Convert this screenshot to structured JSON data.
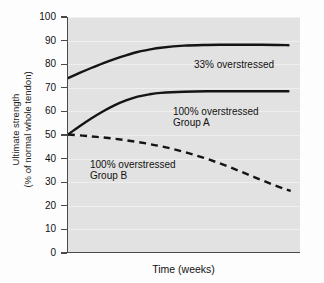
{
  "chart_data": {
    "type": "line",
    "title": "",
    "xlabel": "Time (weeks)",
    "ylabel": "Ultimate strength (% of normal whole tendon)",
    "ylabel_line1": "Ultimate strength",
    "ylabel_line2": "(% of normal whole tendon)",
    "ylim": [
      0,
      100
    ],
    "yticks": [
      100,
      90,
      80,
      70,
      60,
      50,
      40,
      30,
      20,
      10,
      0
    ],
    "ytick_labels": [
      "100",
      "90",
      "80",
      "70",
      "60",
      "50",
      "40",
      "30",
      "20",
      "10",
      "0"
    ],
    "xlim": [
      0,
      10
    ],
    "xticks": [],
    "xtick_labels": [],
    "grid": "horizontal-faint",
    "legend_position": "inline-annotations",
    "plot_background": "#e2e2e2",
    "line_color": "#141414",
    "series": [
      {
        "name": "33% overstressed",
        "style": "solid",
        "x": [
          0.0,
          0.5,
          1.0,
          1.5,
          2.0,
          2.5,
          3.0,
          3.5,
          4.0,
          5.0,
          6.0,
          7.0,
          8.0,
          9.0,
          9.5
        ],
        "values": [
          74.0,
          76.2,
          78.3,
          80.3,
          82.1,
          83.7,
          85.1,
          86.1,
          86.9,
          87.8,
          88.1,
          88.2,
          88.2,
          88.1,
          88.0
        ]
      },
      {
        "name": "100% overstressed Group A",
        "style": "solid",
        "x": [
          0.0,
          0.5,
          1.0,
          1.5,
          2.0,
          2.5,
          3.0,
          3.5,
          4.0,
          5.0,
          6.0,
          7.0,
          8.0,
          9.0,
          9.5
        ],
        "values": [
          50.0,
          53.5,
          56.8,
          59.8,
          62.4,
          64.5,
          66.1,
          67.1,
          67.7,
          68.2,
          68.4,
          68.4,
          68.4,
          68.4,
          68.4
        ]
      },
      {
        "name": "100% overstressed Group B",
        "style": "dashed",
        "x": [
          0.0,
          1.0,
          2.0,
          3.0,
          4.0,
          5.0,
          6.0,
          7.0,
          8.0,
          9.0,
          9.6
        ],
        "values": [
          50.0,
          49.2,
          48.2,
          46.8,
          45.0,
          42.6,
          39.6,
          36.0,
          32.0,
          28.0,
          26.0
        ]
      }
    ],
    "annotations": [
      {
        "text": "33% overstressed",
        "x_px": 193,
        "y_px": 59
      },
      {
        "text": "100% overstressed",
        "x_px": 172,
        "y_px": 106
      },
      {
        "text": "Group A",
        "x_px": 172,
        "y_px": 117
      },
      {
        "text": "100% overstressed",
        "x_px": 89,
        "y_px": 159
      },
      {
        "text": "Group B",
        "x_px": 89,
        "y_px": 170
      }
    ]
  }
}
